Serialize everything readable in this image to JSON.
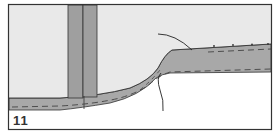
{
  "figure": {
    "panel_label": "11",
    "colors": {
      "background_fill": "#e9e9e9",
      "layer_fill": "#a8a8a8",
      "vertical_column_fill": "#9f9f9f",
      "outline": "#333333",
      "lower_area": "#ffffff"
    },
    "elements": [
      "frame",
      "upper-light-region",
      "vertical-double-column",
      "lower-thin-layer-left",
      "curved-transition-ramp",
      "thick-layer-right",
      "dashed-inner-lines",
      "leader-line-upper",
      "leader-line-lower"
    ]
  }
}
